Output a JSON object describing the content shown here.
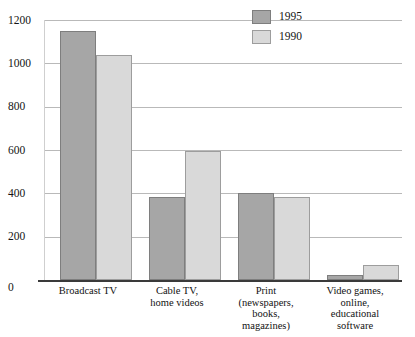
{
  "chart_data": {
    "type": "bar",
    "title": "",
    "subtitle": "",
    "xlabel": "",
    "ylabel": "",
    "ylim": [
      0,
      1200
    ],
    "yticks": [
      0,
      200,
      400,
      600,
      800,
      1000,
      1200
    ],
    "ytick_labels": [
      "0",
      "200",
      "400",
      "600",
      "800",
      "1000",
      "1200"
    ],
    "grid": true,
    "legend_position": "top-right",
    "categories": [
      "Broadcast TV",
      "Cable TV,\nhome videos",
      "Print\n(newspapers,\nbooks,\nmagazines)",
      "Video games,\nonline,\neducational\nsoftware"
    ],
    "series": [
      {
        "name": "1995",
        "color": "#a6a6a6",
        "values": [
          1150,
          385,
          400,
          25
        ]
      },
      {
        "name": "1990",
        "color": "#d9d9d9",
        "values": [
          1040,
          595,
          385,
          70
        ]
      }
    ]
  },
  "legend": {
    "items": [
      {
        "label": "1995"
      },
      {
        "label": "1990"
      }
    ]
  },
  "axis": {
    "y_labels": [
      "1200",
      "1000",
      "800",
      "600",
      "400",
      "200",
      "0"
    ]
  }
}
